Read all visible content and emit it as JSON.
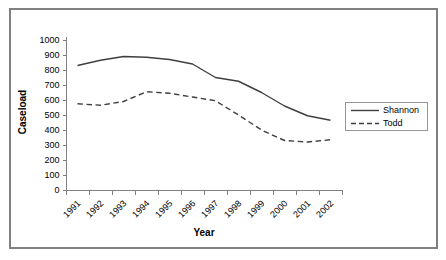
{
  "chart_data": {
    "type": "line",
    "title": "",
    "xlabel": "Year",
    "ylabel": "Caseload",
    "categories": [
      "1991",
      "1992",
      "1993",
      "1994",
      "1995",
      "1996",
      "1997",
      "1998",
      "1999",
      "2000",
      "2001",
      "2002"
    ],
    "series": [
      {
        "name": "Shannon",
        "line_style": "solid",
        "values": [
          830,
          865,
          890,
          885,
          870,
          840,
          750,
          725,
          650,
          560,
          495,
          465
        ]
      },
      {
        "name": "Todd",
        "line_style": "dashed",
        "values": [
          575,
          565,
          590,
          655,
          645,
          620,
          595,
          500,
          400,
          330,
          320,
          335
        ]
      }
    ],
    "ylim": [
      0,
      1000
    ],
    "ytick_step": 100,
    "legend_position": "center-right",
    "grid": false
  },
  "colors": {
    "series_line": "#3f3f3f",
    "axis": "#808080",
    "frame_border": "#808080",
    "legend_border": "#969696",
    "text": "#000000",
    "background": "#ffffff"
  }
}
